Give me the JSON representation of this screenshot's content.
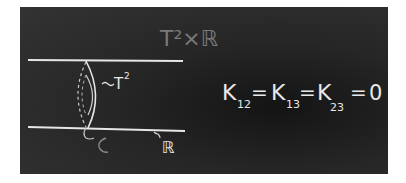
{
  "title_label": "T²×ℝ",
  "labels": {
    "torus": "T",
    "torus_exp": "2",
    "line": "ℝ"
  },
  "equation": {
    "k12_sub": "12",
    "k13_sub": "13",
    "k23_sub": "23",
    "letter": "K",
    "eq": "=",
    "zero": "0"
  },
  "colors": {
    "board": "#2a2a2a",
    "chalk": "#e8e8e8",
    "faint_chalk": "#7a7a7a"
  }
}
